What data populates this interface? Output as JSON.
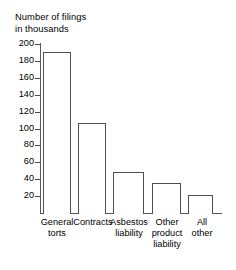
{
  "chart_data": {
    "type": "bar",
    "title": "Number of filings\nin thousands",
    "title_line1": "Number of filings",
    "title_line2": "in thousands",
    "xlabel": "",
    "ylabel": "Number of filings in thousands",
    "categories": [
      "General torts",
      "Contracts",
      "Asbestos liability",
      "Other product liability",
      "All other"
    ],
    "category_lines": [
      [
        "General",
        "torts"
      ],
      [
        "Contracts"
      ],
      [
        "Asbestos",
        "liability"
      ],
      [
        "Other",
        "product",
        "liability"
      ],
      [
        "All",
        "other"
      ]
    ],
    "values": [
      190,
      107,
      48,
      35,
      21
    ],
    "ylim": [
      0,
      200
    ],
    "yticks": [
      200,
      180,
      160,
      140,
      120,
      100,
      80,
      60,
      40,
      20
    ],
    "ytick_labels": [
      "200",
      "180",
      "160",
      "140",
      "120",
      "100",
      "80",
      "60",
      "40",
      "20"
    ],
    "grid": false,
    "legend": false,
    "bar_fill_color": "#ffffff",
    "bar_edge_color": "#4f4f4f",
    "axis_color": "#575757",
    "text_color": "#000000",
    "background_color": "#ffffff"
  },
  "bars": [
    {
      "label": "General torts",
      "value": 190,
      "left": 43,
      "width": 28
    },
    {
      "label": "Contracts",
      "value": 107,
      "left": 78,
      "width": 28
    },
    {
      "label": "Asbestos liability",
      "value": 48,
      "left": 113,
      "width": 31
    },
    {
      "label": "Other product liability",
      "value": 35,
      "left": 152,
      "width": 29
    },
    {
      "label": "All other",
      "value": 21,
      "left": 188,
      "width": 25
    }
  ],
  "cat_positions": [
    {
      "left": 28,
      "width": 58
    },
    {
      "left": 64,
      "width": 58
    },
    {
      "left": 99,
      "width": 60
    },
    {
      "left": 138,
      "width": 58
    },
    {
      "left": 176,
      "width": 52
    }
  ]
}
